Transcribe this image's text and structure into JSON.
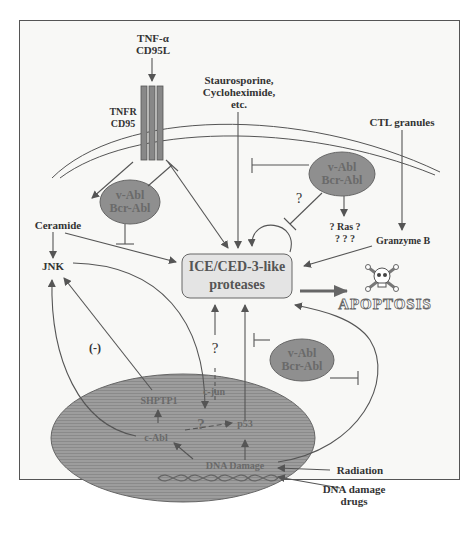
{
  "diagram": {
    "type": "signaling-pathway",
    "membrane_receptor": {
      "ligand": [
        "TNF-α",
        "CD95L"
      ],
      "receptor": [
        "TNFR",
        "CD95"
      ]
    },
    "stimuli": {
      "drugs": [
        "Staurosporine,",
        "Cycloheximide,",
        "etc."
      ],
      "ctl": "CTL granules",
      "radiation": "Radiation",
      "dna_drugs": [
        "DNA damage",
        "drugs"
      ]
    },
    "nodes": {
      "ceramide": "Ceramide",
      "jnk": "JNK",
      "granzyme": "Granzyme B",
      "ras": "? Ras ?",
      "ras_q": "? ? ?",
      "proteases": [
        "ICE/CED-3-like",
        "proteases"
      ],
      "apoptosis": "APOPTOSIS",
      "negative": "(-)",
      "question": "?"
    },
    "inhibitors": {
      "abl_left": [
        "v-Abl",
        "Bcr-Abl"
      ],
      "abl_top_right": [
        "v-Abl",
        "Bcr-Abl"
      ],
      "abl_bottom_right": [
        "v-Abl",
        "Bcr-Abl"
      ]
    },
    "nucleus": {
      "shptp1": "SHPTP1",
      "cjun": "c-jun",
      "cabl": "c-Abl",
      "p53": "p53",
      "dna_damage": "DNA Damage",
      "question": "?"
    },
    "colors": {
      "inhibitor_fill": "#8f8f8f",
      "nucleus_fill": "#9a9a9a",
      "protease_fill": "#e4e4e4",
      "line": "#555555"
    }
  }
}
